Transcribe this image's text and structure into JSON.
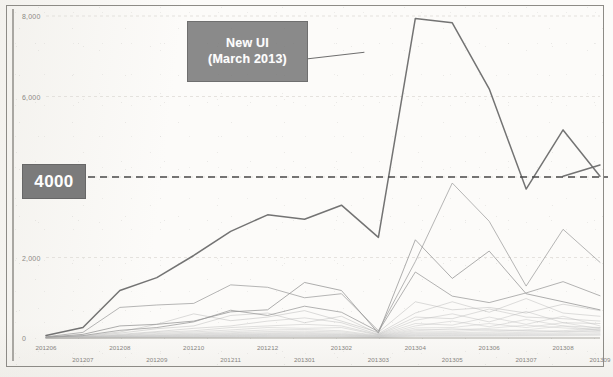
{
  "annotation": {
    "line1": "New UI",
    "line2": "(March 2013)"
  },
  "reference": {
    "badge_label": "4000",
    "value": 4000,
    "style": "dashed",
    "color": "#4a4a4a"
  },
  "colors": {
    "primary_series": "#6b6b6b",
    "secondary_series": "#9a9a9a",
    "faint_series": "#b4b4b4",
    "badge_fill": "#7b7b7b",
    "callout_fill": "#8a8a8a",
    "axis": "#a9a7a2",
    "gridline": "#dedcd7",
    "label_text": "#8b8984",
    "callout_text": "#fdfdfd"
  },
  "chart_data": {
    "type": "line",
    "title": "",
    "subtitle": "",
    "xlabel": "",
    "ylabel": "",
    "ylim": [
      0,
      8000
    ],
    "yticks": [
      0,
      2000,
      4000,
      6000,
      8000
    ],
    "ytick_labels": [
      "0",
      "2,000",
      "4,000",
      "6,000",
      "8,000"
    ],
    "grid": true,
    "legend": "none",
    "x": [
      "201206",
      "201207",
      "201208",
      "201209",
      "201210",
      "201211",
      "201212",
      "201301",
      "201302",
      "201303",
      "201304",
      "201305",
      "201306",
      "201307",
      "201308",
      "201309"
    ],
    "xtick_labels_row1": [
      "201206",
      "",
      "201207",
      "",
      "201208",
      "",
      "201211",
      "",
      "201301",
      "",
      "201303",
      "",
      "201305",
      "",
      "201307",
      "",
      "201309"
    ],
    "xtick_labels_row2": [
      "",
      "201206",
      "",
      "201209",
      "",
      "201210",
      "",
      "201212",
      "",
      "201302",
      "",
      "201304",
      "",
      "201306",
      "",
      "201308",
      ""
    ],
    "annotations": [
      {
        "text": "New UI (March 2013)",
        "points_to_x": "201302",
        "points_to_y": 7100
      },
      {
        "text": "4000",
        "type": "reference-line",
        "y": 4000
      }
    ],
    "series": [
      {
        "name": "primary",
        "emphasis": "high",
        "color": "#6b6b6b",
        "values": [
          60,
          260,
          1180,
          1500,
          2050,
          2650,
          3060,
          2950,
          3300,
          2500,
          7940,
          7830,
          6190,
          3700,
          5170,
          4020
        ]
      },
      {
        "name": "primary-tail",
        "emphasis": "high",
        "color": "#6b6b6b",
        "values": [
          null,
          null,
          null,
          null,
          null,
          null,
          null,
          null,
          null,
          null,
          null,
          null,
          null,
          null,
          4020,
          4300
        ]
      },
      {
        "name": "secondary-a",
        "emphasis": "medium",
        "color": "#9a9a9a",
        "values": [
          30,
          140,
          760,
          820,
          860,
          1320,
          1260,
          1000,
          1100,
          180,
          1900,
          3850,
          2900,
          1290,
          2700,
          1880
        ]
      },
      {
        "name": "secondary-b",
        "emphasis": "medium",
        "color": "#8f8f8f",
        "values": [
          20,
          90,
          300,
          340,
          420,
          650,
          700,
          1380,
          1180,
          120,
          2440,
          1480,
          2160,
          1100,
          900,
          700
        ]
      },
      {
        "name": "secondary-c",
        "emphasis": "medium",
        "color": "#969696",
        "values": [
          15,
          60,
          190,
          260,
          400,
          690,
          560,
          790,
          640,
          160,
          1640,
          1040,
          880,
          1120,
          1400,
          1050
        ]
      },
      {
        "name": "low-a",
        "emphasis": "low",
        "color": "#a8a8a8",
        "values": [
          10,
          50,
          150,
          340,
          600,
          430,
          520,
          680,
          420,
          140,
          900,
          700,
          760,
          620,
          840,
          680
        ]
      },
      {
        "name": "low-b",
        "emphasis": "low",
        "color": "#adadad",
        "values": [
          8,
          40,
          120,
          230,
          300,
          560,
          620,
          380,
          540,
          110,
          620,
          900,
          640,
          980,
          620,
          540
        ]
      },
      {
        "name": "low-c",
        "emphasis": "low",
        "color": "#b0b0b0",
        "values": [
          6,
          30,
          90,
          160,
          240,
          300,
          420,
          500,
          380,
          90,
          520,
          480,
          720,
          520,
          480,
          420
        ]
      },
      {
        "name": "low-d",
        "emphasis": "low",
        "color": "#b4b4b4",
        "values": [
          5,
          25,
          70,
          140,
          180,
          260,
          300,
          340,
          300,
          80,
          440,
          600,
          400,
          660,
          380,
          360
        ]
      },
      {
        "name": "low-e",
        "emphasis": "low",
        "color": "#b8b8b8",
        "values": [
          4,
          20,
          60,
          110,
          150,
          200,
          260,
          240,
          260,
          70,
          360,
          320,
          520,
          340,
          540,
          300
        ]
      },
      {
        "name": "low-f",
        "emphasis": "low",
        "color": "#bbbbbb",
        "values": [
          4,
          16,
          50,
          90,
          120,
          160,
          200,
          210,
          180,
          60,
          300,
          420,
          280,
          460,
          300,
          260
        ]
      },
      {
        "name": "low-g",
        "emphasis": "low",
        "color": "#bebebe",
        "values": [
          3,
          14,
          40,
          70,
          100,
          130,
          160,
          170,
          150,
          50,
          250,
          260,
          360,
          260,
          380,
          230
        ]
      },
      {
        "name": "low-h",
        "emphasis": "low",
        "color": "#c0c0c0",
        "values": [
          3,
          12,
          34,
          60,
          85,
          110,
          130,
          140,
          120,
          45,
          210,
          200,
          240,
          320,
          250,
          200
        ]
      },
      {
        "name": "low-i",
        "emphasis": "low",
        "color": "#c2c2c2",
        "values": [
          2,
          10,
          28,
          50,
          70,
          90,
          110,
          115,
          100,
          40,
          180,
          230,
          190,
          200,
          300,
          180
        ]
      },
      {
        "name": "low-j",
        "emphasis": "low",
        "color": "#c4c4c4",
        "values": [
          2,
          9,
          24,
          42,
          58,
          76,
          92,
          96,
          86,
          34,
          150,
          160,
          210,
          170,
          180,
          260
        ]
      },
      {
        "name": "low-k",
        "emphasis": "low",
        "color": "#c6c6c6",
        "values": [
          2,
          8,
          20,
          36,
          48,
          64,
          78,
          80,
          72,
          30,
          128,
          134,
          150,
          190,
          150,
          220
        ]
      },
      {
        "name": "low-l",
        "emphasis": "low",
        "color": "#c8c8c8",
        "values": [
          1,
          7,
          17,
          30,
          40,
          54,
          66,
          68,
          60,
          26,
          108,
          112,
          126,
          140,
          170,
          160
        ]
      },
      {
        "name": "low-m",
        "emphasis": "low",
        "color": "#cacaca",
        "values": [
          1,
          6,
          14,
          26,
          34,
          45,
          55,
          57,
          50,
          22,
          90,
          96,
          104,
          116,
          130,
          190
        ]
      },
      {
        "name": "low-n",
        "emphasis": "low",
        "color": "#cccccc",
        "values": [
          1,
          5,
          12,
          22,
          29,
          38,
          46,
          48,
          42,
          19,
          76,
          80,
          88,
          98,
          108,
          140
        ]
      },
      {
        "name": "low-o",
        "emphasis": "low",
        "color": "#cecece",
        "values": [
          1,
          4,
          10,
          18,
          24,
          32,
          39,
          40,
          35,
          16,
          64,
          68,
          74,
          82,
          90,
          110
        ]
      },
      {
        "name": "low-p",
        "emphasis": "low",
        "color": "#d0d0d0",
        "values": [
          1,
          4,
          9,
          15,
          20,
          27,
          33,
          34,
          30,
          14,
          54,
          57,
          62,
          69,
          76,
          92
        ]
      },
      {
        "name": "low-q",
        "emphasis": "low",
        "color": "#d2d2d2",
        "values": [
          0,
          3,
          7,
          13,
          17,
          22,
          27,
          28,
          25,
          11,
          45,
          48,
          52,
          58,
          64,
          78
        ]
      },
      {
        "name": "low-r",
        "emphasis": "low",
        "color": "#d4d4d4",
        "values": [
          0,
          2,
          6,
          11,
          14,
          19,
          23,
          24,
          21,
          9,
          38,
          40,
          44,
          49,
          54,
          66
        ]
      }
    ]
  }
}
